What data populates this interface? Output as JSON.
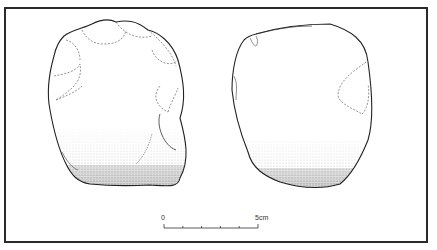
{
  "figure": {
    "views": [
      {
        "name": "left-view",
        "label": "dorsal face with flake scars"
      },
      {
        "name": "right-view",
        "label": "ventral face / cortex"
      }
    ],
    "scale_bar": {
      "start_label": "0",
      "end_label": "5cm",
      "ticks": 6
    },
    "colors": {
      "line": "#222222",
      "scar_line": "#555555",
      "frame": "#2a2a2a",
      "background": "#ffffff"
    }
  }
}
